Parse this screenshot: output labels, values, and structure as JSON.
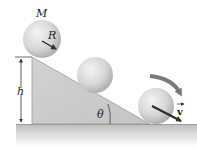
{
  "diagram": {
    "labels": {
      "mass": "M",
      "radius": "R",
      "height": "h",
      "angle": "θ",
      "velocity": "v"
    },
    "colors": {
      "incline_fill": "#cdcdcd",
      "incline_edge": "#8a8a8a",
      "sphere_light": "#f0f0f0",
      "sphere_dark": "#b5b5b5",
      "ground_top": "#c8c8c8",
      "ground_bottom": "#ffffff",
      "arrow": "#3a3a3a",
      "rotation_arrow": "#777777"
    },
    "elements": [
      {
        "name": "sphere-top",
        "position": "top of incline"
      },
      {
        "name": "sphere-middle",
        "position": "mid incline"
      },
      {
        "name": "sphere-bottom",
        "position": "bottom on ground"
      },
      {
        "name": "incline",
        "shape": "right triangle"
      },
      {
        "name": "height-dimension",
        "label": "h"
      },
      {
        "name": "angle-marker",
        "label": "θ"
      },
      {
        "name": "rotation-arrow",
        "direction": "clockwise"
      },
      {
        "name": "velocity-vector",
        "label": "v"
      }
    ]
  }
}
